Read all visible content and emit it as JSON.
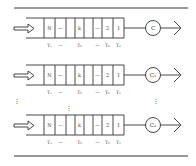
{
  "diagram": {
    "title": "",
    "queues": [
      {
        "server_label": "C",
        "cells": [
          "N",
          "...",
          "",
          "k",
          "",
          "...",
          "2",
          "1"
        ],
        "times": [
          "T_N",
          "...",
          "T_k",
          "...",
          "T_2",
          "T_1"
        ]
      },
      {
        "server_label": "C₁",
        "cells": [
          "N",
          "...",
          "",
          "k",
          "",
          "...",
          "2",
          "1"
        ],
        "times": [
          "T_N",
          "...",
          "T_k",
          "...",
          "T_2",
          "T_1"
        ]
      },
      {
        "server_label": "Cₙ",
        "cells": [
          "N",
          "...",
          "",
          "k",
          "",
          "...",
          "2",
          "1"
        ],
        "times": [
          "T_N",
          "...",
          "T_k",
          "...",
          "T_2",
          "T_1"
        ]
      }
    ],
    "ellipsis": "⋮",
    "cell_text": {
      "N": "N",
      "dots": "—",
      "k": "k",
      "two": "2",
      "one": "1"
    },
    "time_text": {
      "TN": "Tₙ",
      "dots": "—",
      "Tk": "Tₖ",
      "T2": "T₂",
      "T1": "T₁"
    },
    "servers": [
      "C",
      "C₁",
      "Cₙ"
    ]
  }
}
